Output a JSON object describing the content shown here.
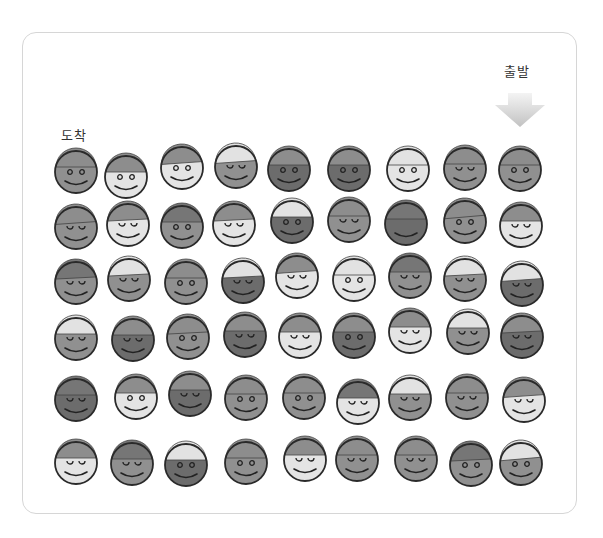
{
  "labels": {
    "start": "출발",
    "arrive": "도착"
  },
  "icons": {
    "arrow": "down-arrow-icon",
    "face": "smiley-with-cap-icon"
  },
  "colors": {
    "face_light": "#e4e4e4",
    "face_mid": "#909090",
    "face_dark": "#6c6c6c",
    "hat_light": "#e2e2e2",
    "hat_mid": "#8d8d8d",
    "hat_dark": "#767676",
    "outline": "#2a2a2a",
    "border": "#d6d6d6",
    "arrow_top": "#f2f2f2",
    "arrow_bottom": "#c4c4c4"
  },
  "grid": {
    "rows": 6,
    "cols": 9,
    "faces": [
      [
        {
          "x": 76,
          "y": 172,
          "face": "mid",
          "hat": "mid",
          "eyes": "o"
        },
        {
          "x": 126,
          "y": 177,
          "face": "light",
          "hat": "mid",
          "eyes": "o"
        },
        {
          "x": 182,
          "y": 168,
          "face": "light",
          "hat": "mid",
          "eyes": "o",
          "tilt": -4
        },
        {
          "x": 236,
          "y": 167,
          "face": "mid",
          "hat": "light",
          "eyes": "c",
          "tilt": -4
        },
        {
          "x": 289,
          "y": 170,
          "face": "dark",
          "hat": "mid",
          "eyes": "o"
        },
        {
          "x": 349,
          "y": 170,
          "face": "dark",
          "hat": "mid",
          "eyes": "o"
        },
        {
          "x": 408,
          "y": 170,
          "face": "light",
          "hat": "light",
          "eyes": "o"
        },
        {
          "x": 465,
          "y": 169,
          "face": "mid",
          "hat": "mid",
          "eyes": "c"
        },
        {
          "x": 520,
          "y": 170,
          "face": "mid",
          "hat": "mid",
          "eyes": "o"
        }
      ],
      [
        {
          "x": 76,
          "y": 228,
          "face": "mid",
          "hat": "mid",
          "eyes": "c",
          "tilt": -4
        },
        {
          "x": 128,
          "y": 225,
          "face": "light",
          "hat": "mid",
          "eyes": "c",
          "tilt": -3
        },
        {
          "x": 182,
          "y": 227,
          "face": "mid",
          "hat": "dark",
          "eyes": "o"
        },
        {
          "x": 234,
          "y": 225,
          "face": "light",
          "hat": "mid",
          "eyes": "c",
          "tilt": -3
        },
        {
          "x": 292,
          "y": 222,
          "face": "dark",
          "hat": "light",
          "eyes": "o"
        },
        {
          "x": 349,
          "y": 221,
          "face": "mid",
          "hat": "mid",
          "eyes": "c"
        },
        {
          "x": 406,
          "y": 224,
          "face": "dark",
          "hat": "dark",
          "eyes": "none"
        },
        {
          "x": 465,
          "y": 222,
          "face": "mid",
          "hat": "mid",
          "eyes": "o",
          "tilt": -5
        },
        {
          "x": 521,
          "y": 226,
          "face": "light",
          "hat": "mid",
          "eyes": "c"
        }
      ],
      [
        {
          "x": 76,
          "y": 283,
          "face": "mid",
          "hat": "dark",
          "eyes": "c",
          "tilt": -3
        },
        {
          "x": 129,
          "y": 280,
          "face": "mid",
          "hat": "light",
          "eyes": "c",
          "tilt": -3
        },
        {
          "x": 186,
          "y": 283,
          "face": "mid",
          "hat": "mid",
          "eyes": "o"
        },
        {
          "x": 243,
          "y": 282,
          "face": "dark",
          "hat": "light",
          "eyes": "c",
          "tilt": -3
        },
        {
          "x": 297,
          "y": 277,
          "face": "light",
          "hat": "mid",
          "eyes": "c",
          "tilt": -4
        },
        {
          "x": 354,
          "y": 280,
          "face": "light",
          "hat": "light",
          "eyes": "o"
        },
        {
          "x": 410,
          "y": 277,
          "face": "mid",
          "hat": "dark",
          "eyes": "c"
        },
        {
          "x": 465,
          "y": 280,
          "face": "mid",
          "hat": "light",
          "eyes": "c",
          "tilt": -3
        },
        {
          "x": 522,
          "y": 285,
          "face": "dark",
          "hat": "light",
          "eyes": "c",
          "tilt": -4
        }
      ],
      [
        {
          "x": 76,
          "y": 339,
          "face": "mid",
          "hat": "light",
          "eyes": "c"
        },
        {
          "x": 133,
          "y": 340,
          "face": "dark",
          "hat": "mid",
          "eyes": "c"
        },
        {
          "x": 188,
          "y": 338,
          "face": "mid",
          "hat": "mid",
          "eyes": "o",
          "tilt": -3
        },
        {
          "x": 245,
          "y": 336,
          "face": "dark",
          "hat": "mid",
          "eyes": "c"
        },
        {
          "x": 300,
          "y": 337,
          "face": "light",
          "hat": "mid",
          "eyes": "c"
        },
        {
          "x": 354,
          "y": 337,
          "face": "dark",
          "hat": "mid",
          "eyes": "o"
        },
        {
          "x": 410,
          "y": 332,
          "face": "light",
          "hat": "mid",
          "eyes": "c"
        },
        {
          "x": 468,
          "y": 333,
          "face": "mid",
          "hat": "light",
          "eyes": "c"
        },
        {
          "x": 522,
          "y": 337,
          "face": "dark",
          "hat": "mid",
          "eyes": "c",
          "tilt": -3
        }
      ],
      [
        {
          "x": 76,
          "y": 400,
          "face": "dark",
          "hat": "dark",
          "eyes": "c"
        },
        {
          "x": 136,
          "y": 398,
          "face": "light",
          "hat": "mid",
          "eyes": "o"
        },
        {
          "x": 190,
          "y": 395,
          "face": "dark",
          "hat": "mid",
          "eyes": "c"
        },
        {
          "x": 246,
          "y": 399,
          "face": "mid",
          "hat": "mid",
          "eyes": "o"
        },
        {
          "x": 304,
          "y": 398,
          "face": "mid",
          "hat": "mid",
          "eyes": "o"
        },
        {
          "x": 358,
          "y": 403,
          "face": "light",
          "hat": "dark",
          "eyes": "c"
        },
        {
          "x": 410,
          "y": 399,
          "face": "mid",
          "hat": "light",
          "eyes": "c"
        },
        {
          "x": 467,
          "y": 398,
          "face": "mid",
          "hat": "mid",
          "eyes": "c"
        },
        {
          "x": 524,
          "y": 401,
          "face": "light",
          "hat": "mid",
          "eyes": "c",
          "tilt": -4
        }
      ],
      [
        {
          "x": 76,
          "y": 463,
          "face": "light",
          "hat": "mid",
          "eyes": "c"
        },
        {
          "x": 132,
          "y": 464,
          "face": "mid",
          "hat": "dark",
          "eyes": "c"
        },
        {
          "x": 186,
          "y": 465,
          "face": "dark",
          "hat": "light",
          "eyes": "o"
        },
        {
          "x": 246,
          "y": 463,
          "face": "mid",
          "hat": "mid",
          "eyes": "o"
        },
        {
          "x": 305,
          "y": 460,
          "face": "light",
          "hat": "mid",
          "eyes": "c"
        },
        {
          "x": 357,
          "y": 460,
          "face": "mid",
          "hat": "mid",
          "eyes": "c"
        },
        {
          "x": 416,
          "y": 460,
          "face": "mid",
          "hat": "mid",
          "eyes": "c"
        },
        {
          "x": 471,
          "y": 465,
          "face": "mid",
          "hat": "dark",
          "eyes": "o",
          "tilt": -3
        },
        {
          "x": 521,
          "y": 464,
          "face": "mid",
          "hat": "light",
          "eyes": "o",
          "tilt": -5
        }
      ]
    ]
  }
}
